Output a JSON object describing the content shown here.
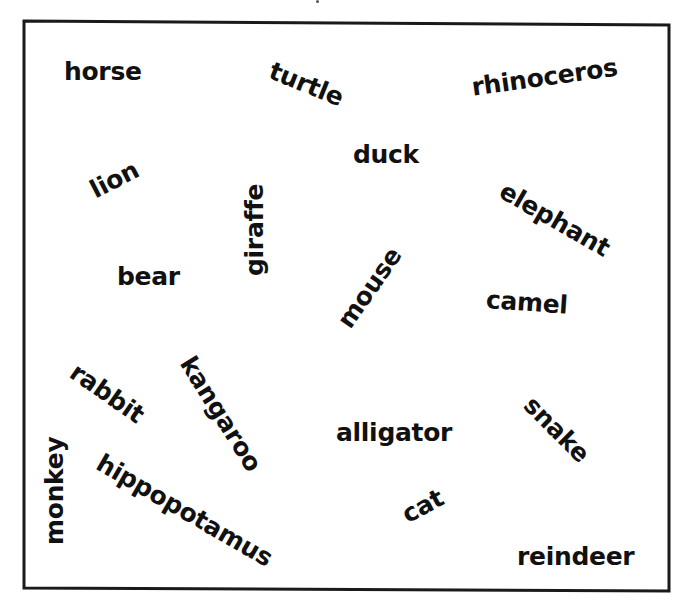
{
  "worksheet": {
    "colors": {
      "border": "#1a1a1a",
      "text": "#111111",
      "background": "#ffffff"
    },
    "words": [
      {
        "text": "horse",
        "x": 64,
        "y": 59,
        "rotate": 0
      },
      {
        "text": "turtle",
        "x": 275,
        "y": 58,
        "rotate": 22
      },
      {
        "text": "rhinoceros",
        "x": 470,
        "y": 75,
        "rotate": -8
      },
      {
        "text": "duck",
        "x": 353,
        "y": 142,
        "rotate": 0
      },
      {
        "text": "lion",
        "x": 86,
        "y": 180,
        "rotate": -27
      },
      {
        "text": "elephant",
        "x": 508,
        "y": 178,
        "rotate": 30
      },
      {
        "text": "giraffe",
        "x": 242,
        "y": 276,
        "rotate": -90
      },
      {
        "text": "bear",
        "x": 117,
        "y": 264,
        "rotate": 0
      },
      {
        "text": "mouse",
        "x": 333,
        "y": 318,
        "rotate": -55
      },
      {
        "text": "camel",
        "x": 487,
        "y": 287,
        "rotate": 4
      },
      {
        "text": "rabbit",
        "x": 80,
        "y": 359,
        "rotate": 35
      },
      {
        "text": "kangaroo",
        "x": 197,
        "y": 352,
        "rotate": 58
      },
      {
        "text": "alligator",
        "x": 336,
        "y": 420,
        "rotate": 0
      },
      {
        "text": "snake",
        "x": 537,
        "y": 392,
        "rotate": 45
      },
      {
        "text": "monkey",
        "x": 42,
        "y": 545,
        "rotate": -90
      },
      {
        "text": "hippopotamus",
        "x": 105,
        "y": 450,
        "rotate": 30
      },
      {
        "text": "cat",
        "x": 398,
        "y": 505,
        "rotate": -28
      },
      {
        "text": "reindeer",
        "x": 517,
        "y": 544,
        "rotate": 0
      }
    ]
  }
}
